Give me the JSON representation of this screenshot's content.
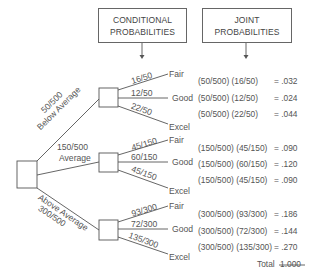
{
  "headers": {
    "conditional": [
      "CONDITIONAL",
      "PROBABILITIES"
    ],
    "joint": [
      "JOINT",
      "PROBABILITIES"
    ]
  },
  "branches": [
    {
      "prob": "50/500",
      "label": "Below Average",
      "children": [
        {
          "prob": "16/50",
          "outcome": "Fair",
          "joint_expr": "(50/500) (16/50)",
          "joint_val": "= .032"
        },
        {
          "prob": "12/50",
          "outcome": "Good",
          "joint_expr": "(50/500) (12/50)",
          "joint_val": "= .024"
        },
        {
          "prob": "22/50",
          "outcome": "Excel",
          "joint_expr": "(50/500) (22/50)",
          "joint_val": "= .044"
        }
      ]
    },
    {
      "prob": "150/500",
      "label": "Average",
      "children": [
        {
          "prob": "45/150",
          "outcome": "Fair",
          "joint_expr": "(150/500) (45/150)",
          "joint_val": "= .090"
        },
        {
          "prob": "60/150",
          "outcome": "Good",
          "joint_expr": "(150/500) (60/150)",
          "joint_val": "= .120"
        },
        {
          "prob": "45/150",
          "outcome": "Excel",
          "joint_expr": "(150/500) (45/150)",
          "joint_val": "= .090"
        }
      ]
    },
    {
      "prob": "300/500",
      "label": "Above Average",
      "children": [
        {
          "prob": "93/300",
          "outcome": "Fair",
          "joint_expr": "(300/500) (93/300)",
          "joint_val": "= .186"
        },
        {
          "prob": "72/300",
          "outcome": "Good",
          "joint_expr": "(300/500) (72/300)",
          "joint_val": "= .144"
        },
        {
          "prob": "135/300",
          "outcome": "Excel",
          "joint_expr": "(300/500) (135/300)",
          "joint_val": "= .270"
        }
      ]
    }
  ],
  "total": {
    "label": "Total",
    "value": "1.000"
  },
  "colors": {
    "line": "#555555",
    "text": "#555555",
    "background": "#ffffff"
  }
}
